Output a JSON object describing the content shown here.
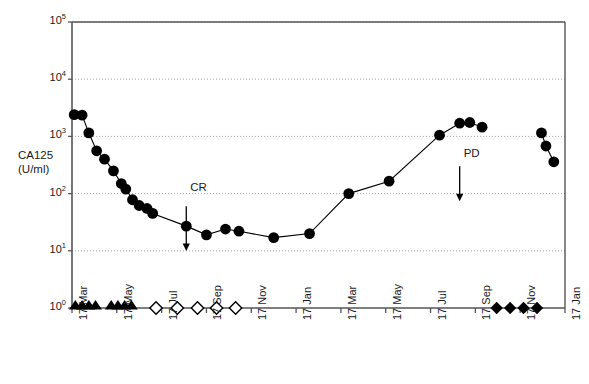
{
  "chart_data": {
    "type": "line",
    "title": "",
    "xlabel": "",
    "ylabel": "CA125 (U/ml)",
    "ylabel_lines": [
      "CA125",
      "(U/ml)"
    ],
    "yscale": "log",
    "ylim": [
      1,
      100000
    ],
    "ytick_values": [
      1,
      10,
      100,
      1000,
      10000,
      100000
    ],
    "ytick_labels": [
      "10",
      "10",
      "10",
      "10",
      "10",
      "10"
    ],
    "ytick_exponents": [
      "0",
      "1",
      "2",
      "3",
      "4",
      "5"
    ],
    "grid": "horizontal-dotted",
    "legend": "none",
    "xtick_labels": [
      "17 Mar",
      "17 May",
      "17 Jul",
      "17 Sep",
      "17 Nov",
      "17 Jan",
      "17 Mar",
      "17 May",
      "17 Jul",
      "17 Sep",
      "17 Nov",
      "17 Jan"
    ],
    "xlim_months": [
      0,
      22
    ],
    "series": [
      {
        "name": "CA125",
        "marker": "filled-circle",
        "line": true,
        "points": [
          {
            "x": 0.1,
            "y": 2400
          },
          {
            "x": 0.45,
            "y": 2350
          },
          {
            "x": 0.75,
            "y": 1150
          },
          {
            "x": 1.1,
            "y": 560
          },
          {
            "x": 1.45,
            "y": 400
          },
          {
            "x": 1.85,
            "y": 250
          },
          {
            "x": 2.2,
            "y": 150
          },
          {
            "x": 2.4,
            "y": 120
          },
          {
            "x": 2.7,
            "y": 78
          },
          {
            "x": 3.0,
            "y": 62
          },
          {
            "x": 3.35,
            "y": 55
          },
          {
            "x": 3.6,
            "y": 45
          },
          {
            "x": 5.1,
            "y": 27
          },
          {
            "x": 6.0,
            "y": 19
          },
          {
            "x": 6.85,
            "y": 24
          },
          {
            "x": 7.45,
            "y": 22
          },
          {
            "x": 9.0,
            "y": 17
          },
          {
            "x": 10.6,
            "y": 20
          },
          {
            "x": 12.35,
            "y": 100
          },
          {
            "x": 14.15,
            "y": 165
          },
          {
            "x": 16.4,
            "y": 1050
          },
          {
            "x": 17.3,
            "y": 1700
          },
          {
            "x": 17.75,
            "y": 1750
          },
          {
            "x": 18.3,
            "y": 1450
          }
        ]
      },
      {
        "name": "CA125 post-PD",
        "marker": "filled-circle",
        "line": true,
        "points": [
          {
            "x": 20.95,
            "y": 1150
          },
          {
            "x": 21.15,
            "y": 680
          },
          {
            "x": 21.5,
            "y": 360
          }
        ]
      }
    ],
    "treatment_markers": [
      {
        "group": "chemotherapy",
        "marker": "filled-triangle-up",
        "y": 1,
        "x_values": [
          0.15,
          0.45,
          0.75,
          1.05,
          1.75,
          2.05,
          2.35,
          2.65
        ]
      },
      {
        "group": "maintenance",
        "marker": "open-diamond",
        "y": 1,
        "x_values": [
          3.75,
          4.7,
          5.6,
          6.45,
          7.3
        ]
      },
      {
        "group": "salvage",
        "marker": "filled-diamond",
        "y": 1,
        "x_values": [
          18.95,
          19.55,
          20.15,
          20.75
        ]
      }
    ],
    "annotations": [
      {
        "label": "CR",
        "x": 5.1,
        "y_label": 120,
        "arrow": "down",
        "arrow_from_y": 60,
        "arrow_to_y": 10.5
      },
      {
        "label": "PD",
        "x": 17.3,
        "y_label": 480,
        "arrow": "down",
        "arrow_from_y": 300,
        "arrow_to_y": 78
      }
    ],
    "colors": {
      "marker": "#000000",
      "line": "#000000",
      "axis": "#555555",
      "grid": "#999999",
      "text": "#1a1a1a",
      "background": "#ffffff"
    }
  }
}
